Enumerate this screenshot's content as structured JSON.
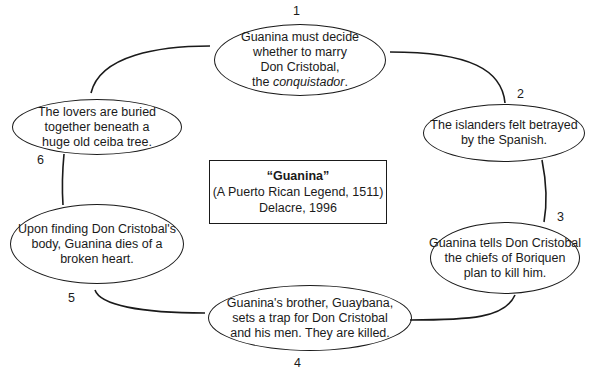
{
  "diagram": {
    "type": "cycle",
    "title_box": {
      "title": "“Guanina”",
      "subtitle": "(A Puerto Rican Legend, 1511)",
      "author_year": "Delacre, 1996"
    },
    "events": [
      {
        "number": "1",
        "lines": [
          "Guanina must decide",
          "whether to marry",
          "Don Cristobal,"
        ],
        "last_line_prefix": "the ",
        "last_line_italic": "conquistador",
        "last_line_suffix": "."
      },
      {
        "number": "2",
        "lines": [
          "The islanders felt betrayed",
          "by the Spanish."
        ]
      },
      {
        "number": "3",
        "lines": [
          "Guanina tells Don Cristobal",
          "the chiefs of Boriquen",
          "plan to kill him."
        ]
      },
      {
        "number": "4",
        "lines": [
          "Guanina's brother, Guaybana,",
          "sets a trap for Don Cristobal",
          "and his men. They are killed."
        ]
      },
      {
        "number": "5",
        "lines": [
          "Upon finding Don Cristobal's",
          "body, Guanina dies of a",
          "broken heart."
        ]
      },
      {
        "number": "6",
        "lines": [
          "The lovers are buried",
          "together beneath a",
          "huge old ceiba tree."
        ]
      }
    ],
    "colors": {
      "stroke": "#1a1a1a",
      "background": "#ffffff"
    }
  }
}
